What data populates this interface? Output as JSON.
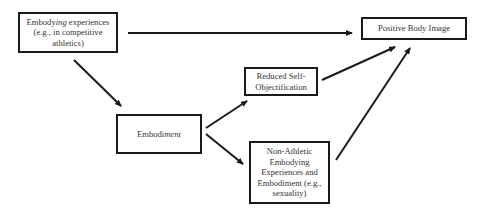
{
  "diagram": {
    "nodes": {
      "embodying": {
        "label_prefix": "Embody",
        "label_italic": "ing",
        "label_rest": " experiences (e.g., in competitive athletics)"
      },
      "positive_body_image": {
        "label": "Positive Body Image"
      },
      "reduced_self_objectification": {
        "label": "Reduced Self-Objectification"
      },
      "embodiment": {
        "label_prefix": "Embodi",
        "label_italic": "ment"
      },
      "non_athletic": {
        "label": "Non-Athletic Embodying Experiences and Embodiment (e.g., sexuality)"
      }
    },
    "edges": [
      {
        "from": "embodying",
        "to": "positive_body_image"
      },
      {
        "from": "embodying",
        "to": "embodiment"
      },
      {
        "from": "embodiment",
        "to": "reduced_self_objectification"
      },
      {
        "from": "embodiment",
        "to": "non_athletic"
      },
      {
        "from": "reduced_self_objectification",
        "to": "positive_body_image"
      },
      {
        "from": "non_athletic",
        "to": "positive_body_image"
      }
    ],
    "colors": {
      "stroke": "#1a1a1a",
      "text": "#333333",
      "background": "#ffffff"
    }
  }
}
